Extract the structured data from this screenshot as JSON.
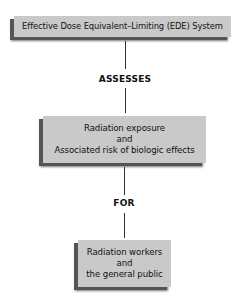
{
  "diagram": {
    "nodes": [
      {
        "id": "ede-system",
        "lines": [
          "Effective Dose Equivalent–Limiting (EDE) System"
        ]
      },
      {
        "id": "radiation-exposure",
        "lines": [
          "Radiation exposure",
          "and",
          "Associated risk of biologic effects"
        ]
      },
      {
        "id": "workers-public",
        "lines": [
          "Radiation workers",
          "and",
          "the general public"
        ]
      }
    ],
    "edges": [
      {
        "from": "ede-system",
        "to": "radiation-exposure",
        "label": "ASSESSES"
      },
      {
        "from": "radiation-exposure",
        "to": "workers-public",
        "label": "FOR"
      }
    ],
    "colors": {
      "box_fill": "#c9c9c9",
      "box_shadow": "#555555",
      "connector": "#333333",
      "background": "#ffffff"
    }
  }
}
